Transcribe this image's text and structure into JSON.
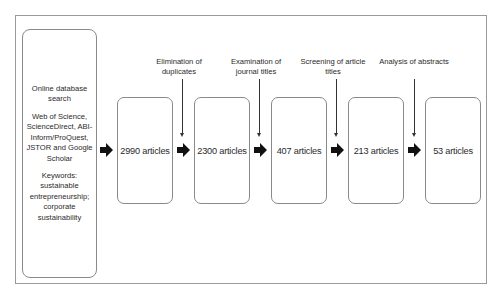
{
  "diagram": {
    "type": "flowchart",
    "source": {
      "title": "Online database search",
      "databases": "Web of Science, ScienceDirect, ABI-Inform/ProQuest, JSTOR and Google Scholar",
      "keywords_label": "Keywords:",
      "keywords": "sustainable entrepreneurship; corporate sustainability"
    },
    "stages": [
      {
        "count_label": "2990 articles"
      },
      {
        "count_label": "2300 articles"
      },
      {
        "count_label": "407 articles"
      },
      {
        "count_label": "213 articles"
      },
      {
        "count_label": "53 articles"
      }
    ],
    "steps": [
      {
        "label": "Elimination of duplicates"
      },
      {
        "label": "Examination of journal titles"
      },
      {
        "label": "Screening of article titles"
      },
      {
        "label": "Analysis of abstracts"
      }
    ],
    "colors": {
      "border": "#8a8a8a",
      "arrow": "#111111",
      "text": "#2a2a2a"
    }
  }
}
